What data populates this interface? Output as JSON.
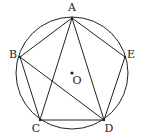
{
  "diagram": {
    "type": "geometry-circle-inscribed-pentagon",
    "circle": {
      "center_label": "O",
      "cx": 72,
      "cy": 73,
      "r": 56
    },
    "points": [
      {
        "label": "A",
        "x": 72,
        "y": 18,
        "lx": 72,
        "ly": 11
      },
      {
        "label": "B",
        "x": 20,
        "y": 57,
        "lx": 13,
        "ly": 58
      },
      {
        "label": "C",
        "x": 40,
        "y": 120,
        "lx": 36,
        "ly": 132
      },
      {
        "label": "D",
        "x": 104,
        "y": 120,
        "lx": 109,
        "ly": 132
      },
      {
        "label": "E",
        "x": 125,
        "y": 57,
        "lx": 131,
        "ly": 58
      }
    ],
    "center": {
      "label": "O",
      "x": 72,
      "y": 73,
      "lx": 77,
      "ly": 84
    },
    "segments": [
      [
        "A",
        "B"
      ],
      [
        "B",
        "C"
      ],
      [
        "C",
        "D"
      ],
      [
        "D",
        "E"
      ],
      [
        "E",
        "A"
      ],
      [
        "A",
        "C"
      ],
      [
        "A",
        "D"
      ],
      [
        "B",
        "D"
      ]
    ],
    "colors": {
      "stroke": "#222222",
      "background": "#ffffff"
    }
  }
}
